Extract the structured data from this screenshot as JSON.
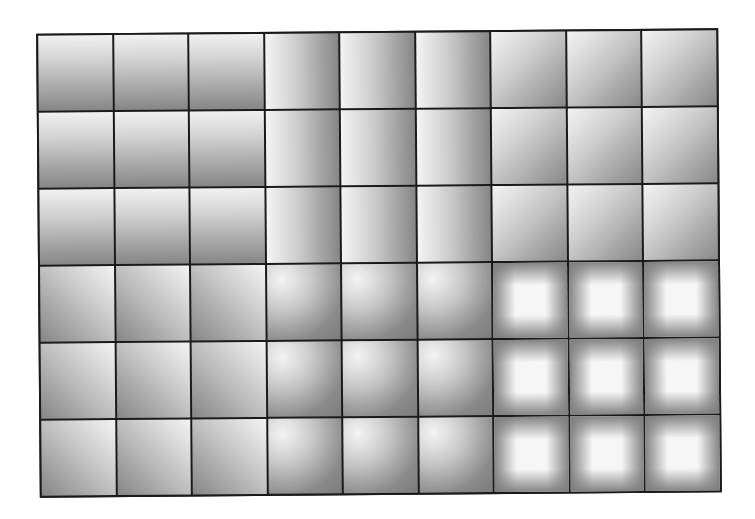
{
  "diagram": {
    "title": "",
    "grid": {
      "columns": 9,
      "rows": 6,
      "line_color": "#1a1a1a"
    },
    "colors": {
      "light": "#fafafa",
      "dark": "#8a8a8a",
      "border": "#1a1a1a",
      "background": "#ffffff"
    },
    "blocks": [
      {
        "id": "top-left",
        "gradient": "linear-vertical",
        "direction": "white top to gray bottom",
        "rows": [
          0,
          1,
          2
        ],
        "cols": [
          0,
          1,
          2
        ],
        "class": "g-vertical"
      },
      {
        "id": "top-middle",
        "gradient": "linear-horizontal",
        "direction": "white left to gray right",
        "rows": [
          0,
          1,
          2
        ],
        "cols": [
          3,
          4,
          5
        ],
        "class": "g-horizontal"
      },
      {
        "id": "top-right",
        "gradient": "linear-diagonal",
        "direction": "white top-left to gray bottom-right",
        "rows": [
          0,
          1,
          2
        ],
        "cols": [
          6,
          7,
          8
        ],
        "class": "g-diag-tl"
      },
      {
        "id": "bottom-left",
        "gradient": "linear-diagonal-reverse",
        "direction": "white top-right to gray bottom-left",
        "rows": [
          3,
          4,
          5
        ],
        "cols": [
          0,
          1,
          2
        ],
        "class": "g-diag-tr"
      },
      {
        "id": "bottom-middle",
        "gradient": "radial-corner",
        "direction": "white near top-left corner radiating out",
        "rows": [
          3,
          4,
          5
        ],
        "cols": [
          3,
          4,
          5
        ],
        "class": "g-corner"
      },
      {
        "id": "bottom-right",
        "gradient": "rectangular-center",
        "direction": "white center to gray edges",
        "rows": [
          3,
          4,
          5
        ],
        "cols": [
          6,
          7,
          8
        ],
        "class": "g-rect"
      }
    ]
  }
}
